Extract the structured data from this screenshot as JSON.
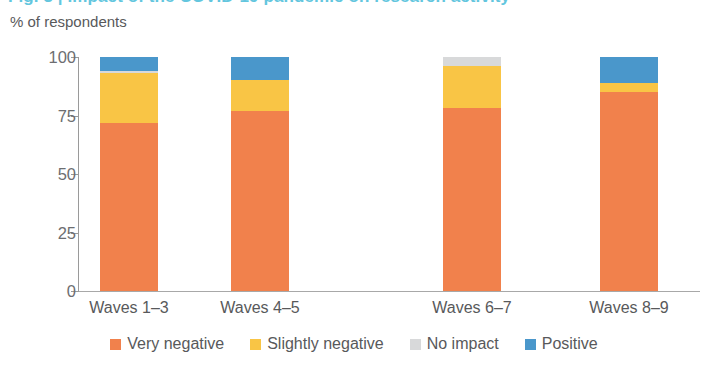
{
  "title": {
    "text": "Fig. 3 | Impact of the COVID-19 pandemic on research activity",
    "color": "#63c6de"
  },
  "axis_title": "% of respondents",
  "colors": {
    "very_negative": "#f1814c",
    "slightly_negative": "#f9c545",
    "no_impact": "#d8d9da",
    "positive": "#4a97cb",
    "axis": "#9a9a9a",
    "text": "#58595b"
  },
  "chart_data": {
    "type": "bar",
    "stacked": true,
    "title": "",
    "xlabel": "",
    "ylabel": "% of respondents",
    "ylim": [
      0,
      100
    ],
    "yticks": [
      0,
      25,
      50,
      75,
      100
    ],
    "ytick_labels": [
      "0",
      "25",
      "50",
      "75",
      "100"
    ],
    "grid": false,
    "legend_position": "bottom",
    "categories": [
      "Waves 1–3",
      "Waves 4–5",
      "Waves 6–7",
      "Waves 8–9"
    ],
    "series": [
      {
        "name": "Very negative",
        "color": "#f1814c",
        "values": [
          72,
          77,
          78,
          85
        ]
      },
      {
        "name": "Slightly negative",
        "color": "#f9c545",
        "values": [
          21,
          13,
          18,
          4
        ]
      },
      {
        "name": "No impact",
        "color": "#d8d9da",
        "values": [
          1,
          0,
          4,
          0
        ]
      },
      {
        "name": "Positive",
        "color": "#4a97cb",
        "values": [
          6,
          10,
          0,
          11
        ]
      }
    ]
  },
  "legend": [
    {
      "label": "Very negative",
      "swatch": "#f1814c",
      "key": "very-negative"
    },
    {
      "label": "Slightly negative",
      "swatch": "#f9c545",
      "key": "slightly-negative"
    },
    {
      "label": "No impact",
      "swatch": "#d8d9da",
      "key": "no-impact"
    },
    {
      "label": "Positive",
      "swatch": "#4a97cb",
      "key": "positive"
    }
  ]
}
